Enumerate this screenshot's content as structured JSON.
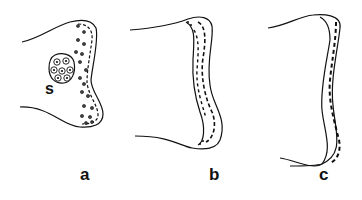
{
  "figure": {
    "panels": [
      {
        "id": "a",
        "label": "a",
        "annotation": "s"
      },
      {
        "id": "b",
        "label": "b"
      },
      {
        "id": "c",
        "label": "c"
      }
    ],
    "colors": {
      "ink": "#111111",
      "background": "#ffffff"
    }
  }
}
